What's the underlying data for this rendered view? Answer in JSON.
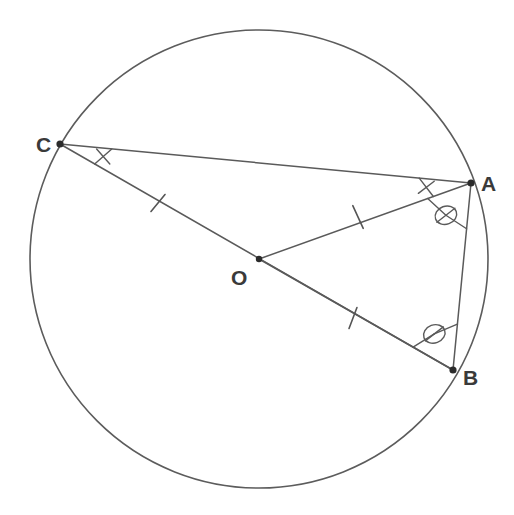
{
  "figure": {
    "kind": "circle-geometry-diagram",
    "background_color": "#ffffff",
    "stroke_color": "#5a5a5a",
    "label_color": "#3a3a3a",
    "canvas": {
      "width": 514,
      "height": 515
    }
  },
  "circle": {
    "name": "main-circle",
    "center_x": 259,
    "center_y": 259,
    "radius": 229
  },
  "points": [
    {
      "id": "A",
      "label": "A",
      "x": 471,
      "y": 183,
      "label_x": 481,
      "label_y": 191
    },
    {
      "id": "B",
      "label": "B",
      "x": 453,
      "y": 370,
      "label_x": 463,
      "label_y": 385
    },
    {
      "id": "C",
      "label": "C",
      "x": 60,
      "y": 144,
      "label_x": 36,
      "label_y": 152
    },
    {
      "id": "O",
      "label": "O",
      "x": 259,
      "y": 259,
      "label_x": 231,
      "label_y": 285
    }
  ],
  "segments": [
    {
      "name": "segment-CA",
      "from": "C",
      "to": "A",
      "ticks": 0
    },
    {
      "name": "segment-CB",
      "from": "C",
      "to": "B",
      "ticks": 0
    },
    {
      "name": "segment-AB",
      "from": "A",
      "to": "B",
      "ticks": 0
    },
    {
      "name": "segment-OA",
      "from": "O",
      "to": "A",
      "ticks": 1
    },
    {
      "name": "segment-OC",
      "from": "O",
      "to": "C",
      "ticks": 1
    },
    {
      "name": "segment-OB",
      "from": "O",
      "to": "B",
      "ticks": 1
    }
  ],
  "tick_marks": [
    {
      "name": "tick-on-OC",
      "on": "segment-OC",
      "x": 158,
      "y": 203
    },
    {
      "name": "tick-on-OA",
      "on": "segment-OA",
      "x": 358,
      "y": 217
    },
    {
      "name": "tick-on-OB",
      "on": "segment-OB",
      "x": 353,
      "y": 318
    }
  ],
  "angle_marks": [
    {
      "name": "angle-mark-at-C",
      "vertex": "C",
      "style": "bar-with-tick",
      "between": [
        "C-A",
        "C-B"
      ]
    },
    {
      "name": "angle-mark-at-A",
      "vertex": "A",
      "style": "bar-with-tick",
      "between": [
        "A-C",
        "A-O"
      ]
    },
    {
      "name": "angle-mark-OAB",
      "vertex": "A",
      "style": "oval-with-slash",
      "between": [
        "A-O",
        "A-B"
      ]
    },
    {
      "name": "angle-mark-OBA",
      "vertex": "B",
      "style": "oval-with-slash",
      "between": [
        "B-O",
        "B-A"
      ]
    }
  ]
}
